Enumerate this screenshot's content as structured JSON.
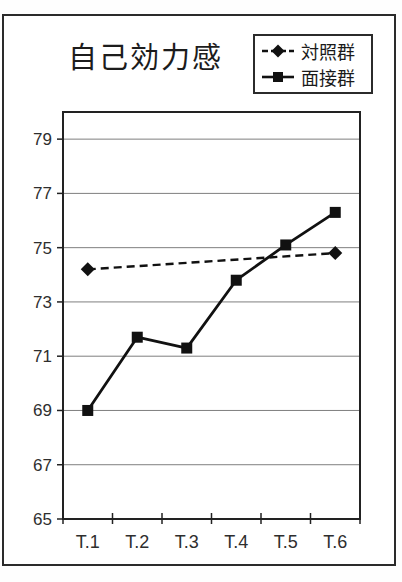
{
  "figure": {
    "title": "自己効力感"
  },
  "legend": {
    "items": [
      {
        "label": "対照群",
        "marker": "diamond",
        "line_style": "dashed"
      },
      {
        "label": "面接群",
        "marker": "square",
        "line_style": "solid"
      }
    ]
  },
  "chart_data": {
    "type": "line",
    "title": "自己効力感",
    "xlabel": "",
    "ylabel": "",
    "categories": [
      "T.1",
      "T.2",
      "T.3",
      "T.4",
      "T.5",
      "T.6"
    ],
    "series": [
      {
        "name": "対照群",
        "marker": "diamond",
        "line_style": "dashed",
        "values": [
          74.2,
          null,
          null,
          null,
          null,
          74.8
        ]
      },
      {
        "name": "面接群",
        "marker": "square",
        "line_style": "solid",
        "values": [
          69.0,
          71.7,
          71.3,
          73.8,
          75.1,
          76.3
        ]
      }
    ],
    "ylim": [
      65,
      80
    ],
    "yticks": [
      65,
      67,
      69,
      71,
      73,
      75,
      77,
      79
    ],
    "grid": true,
    "legend_position": "top-right",
    "colors": {
      "line": "#111111",
      "grid": "#7f7f7f",
      "axis": "#222222",
      "text": "#2e2e2e"
    }
  }
}
